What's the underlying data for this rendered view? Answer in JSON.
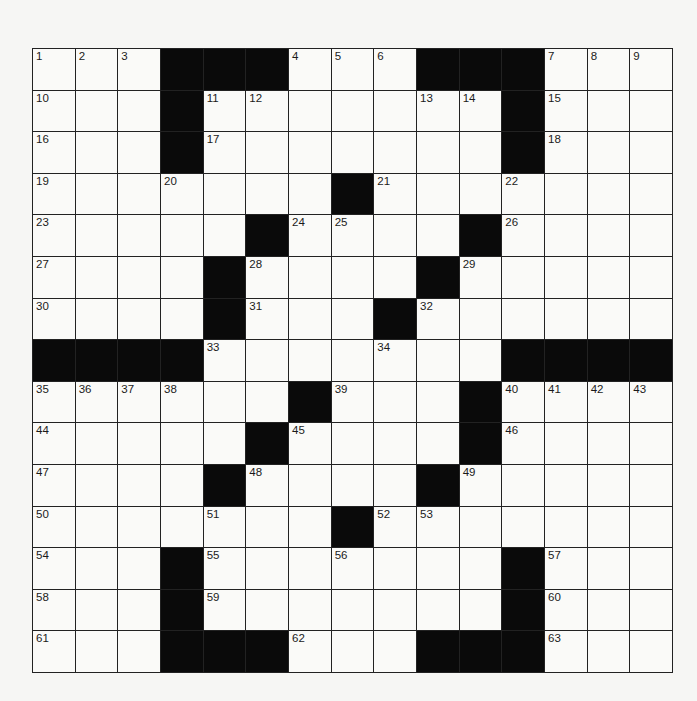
{
  "puzzle": {
    "rows": 15,
    "cols": 15,
    "colors": {
      "black": "#0a0a0a",
      "white": "#fafaf8",
      "line": "#222222",
      "number": "#1a1a1a"
    },
    "layout": [
      "1,2,3,#,#,#,4,5,6,#,#,#,7,8,9",
      "10,.,.,#,11,12,.,.,.,13,14,#,15,.,.",
      "16,.,.,#,17,.,.,.,.,.,.,#,18,.,.",
      "19,.,.,20,.,.,.,#,21,.,.,22,.,.,.",
      "23,.,.,.,.,#,24,25,.,.,#,26,.,.,.",
      "27,.,.,.,#,28,.,.,.,#,29,.,.,.,.",
      "30,.,.,.,#,31,.,.,#,32,.,.,.,.,.",
      "#,#,#,#,33,.,.,.,34,.,.,#,#,#,#",
      "35,36,37,38,.,.,#,39,.,.,#,40,41,42,43",
      "44,.,.,.,.,#,45,.,.,.,#,46,.,.,.",
      "47,.,.,.,#,48,.,.,.,#,49,.,.,.,.",
      "50,.,.,.,51,.,.,#,52,53,.,.,.,.,.",
      "54,.,.,#,55,.,.,56,.,.,.,#,57,.,.",
      "58,.,.,#,59,.,.,.,.,.,.,#,60,.,.",
      "61,.,.,#,#,#,62,.,.,#,#,#,63,.,."
    ]
  }
}
